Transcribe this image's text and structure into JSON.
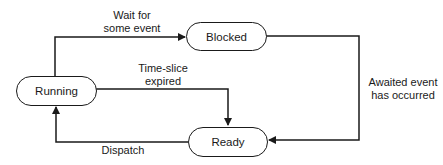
{
  "diagram": {
    "type": "state-transition",
    "states": [
      {
        "id": "running",
        "label": "Running"
      },
      {
        "id": "blocked",
        "label": "Blocked"
      },
      {
        "id": "ready",
        "label": "Ready"
      }
    ],
    "transitions": [
      {
        "from": "running",
        "to": "blocked",
        "label_line1": "Wait for",
        "label_line2": "some event"
      },
      {
        "from": "running",
        "to": "ready",
        "label_line1": "Time-slice",
        "label_line2": "expired"
      },
      {
        "from": "blocked",
        "to": "ready",
        "label_line1": "Awaited event",
        "label_line2": "has occurred"
      },
      {
        "from": "ready",
        "to": "running",
        "label_line1": "Dispatch"
      }
    ],
    "colors": {
      "line": "#1a1a1a",
      "background": "#ffffff"
    }
  }
}
